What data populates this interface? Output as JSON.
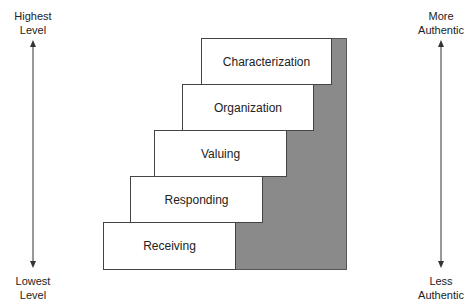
{
  "left_axis": {
    "top_label_line1": "Highest",
    "top_label_line2": "Level",
    "bottom_label_line1": "Lowest",
    "bottom_label_line2": "Level"
  },
  "right_axis": {
    "top_label_line1": "More",
    "top_label_line2": "Authentic",
    "bottom_label_line1": "Less",
    "bottom_label_line2": "Authentic"
  },
  "steps": [
    {
      "label": "Characterization"
    },
    {
      "label": "Organization"
    },
    {
      "label": "Valuing"
    },
    {
      "label": "Responding"
    },
    {
      "label": "Receiving"
    }
  ],
  "colors": {
    "shade": "#8a8a8a",
    "border": "#444444"
  }
}
